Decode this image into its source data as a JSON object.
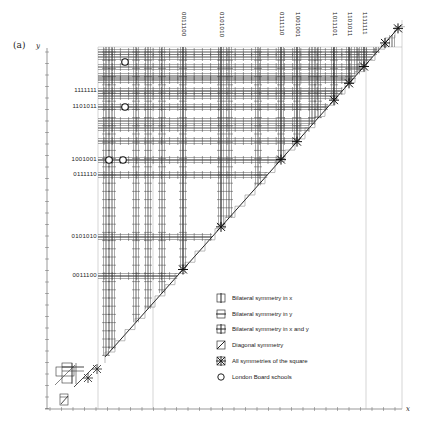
{
  "figure": {
    "panel_label": "(a)",
    "axis_y_label": "y",
    "axis_x_label": "x"
  },
  "left_codes": [
    {
      "label": "1111111",
      "y": 91
    },
    {
      "label": "1101011",
      "y": 107
    },
    {
      "label": "1001001",
      "y": 160
    },
    {
      "label": "0111110",
      "y": 175
    },
    {
      "label": "0101010",
      "y": 237
    },
    {
      "label": "0011100",
      "y": 276
    }
  ],
  "top_codes": [
    {
      "label": "0011100",
      "x": 183
    },
    {
      "label": "0101010",
      "x": 221
    },
    {
      "label": "0111110",
      "x": 281
    },
    {
      "label": "1001001",
      "x": 297
    },
    {
      "label": "1011101",
      "x": 334
    },
    {
      "label": "1101011",
      "x": 349
    },
    {
      "label": "1111111",
      "x": 364
    }
  ],
  "legend": {
    "items": [
      {
        "icon": "bilateral-x-icon",
        "label": "Bilateral symmetry in x"
      },
      {
        "icon": "bilateral-y-icon",
        "label": "Bilateral symmetry in y"
      },
      {
        "icon": "bilateral-xy-icon",
        "label": "Bilateral symmetry in x and y"
      },
      {
        "icon": "diagonal-icon",
        "label": "Diagonal symmetry"
      },
      {
        "icon": "all-symmetries-icon",
        "label": "All symmetries of the square"
      },
      {
        "icon": "circle-icon",
        "label": "London Board schools"
      }
    ]
  },
  "london_board_schools": [
    {
      "x": 125,
      "y": 62
    },
    {
      "x": 125,
      "y": 107
    },
    {
      "x": 109,
      "y": 160
    },
    {
      "x": 123,
      "y": 160
    }
  ],
  "colors": {
    "ink": "#222222",
    "grid_light": "#9a9a9a",
    "background": "#ffffff"
  }
}
